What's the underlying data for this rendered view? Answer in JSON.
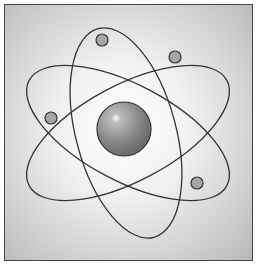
{
  "diagram": {
    "nucleus": {
      "cx": 124,
      "cy": 129,
      "r": 27,
      "color": "#8a8a8a"
    },
    "orbits": [
      {
        "cx": 128,
        "cy": 133,
        "rx": 112,
        "ry": 48,
        "rotate": -28
      },
      {
        "cx": 128,
        "cy": 133,
        "rx": 112,
        "ry": 48,
        "rotate": 28
      },
      {
        "cx": 126,
        "cy": 133,
        "rx": 108,
        "ry": 50,
        "rotate": 75
      }
    ],
    "electrons": [
      {
        "cx": 102,
        "cy": 40
      },
      {
        "cx": 175,
        "cy": 57
      },
      {
        "cx": 51,
        "cy": 118
      },
      {
        "cx": 197,
        "cy": 183
      }
    ],
    "electron_color": "#a6a6a6",
    "line_color": "#333333"
  }
}
